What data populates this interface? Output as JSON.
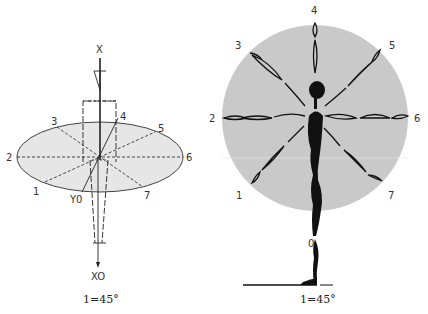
{
  "colors": {
    "background": "#ffffff",
    "ellipse_fill": "#e6e6e6",
    "circle_fill": "#c9c9c9",
    "ink": "#111111",
    "label": "#333333"
  },
  "left_figure": {
    "title": "ellipse projection of direction system",
    "axis_top_label": "X",
    "axis_bottom_label": "XO",
    "origin_label": "Y0",
    "direction_labels": {
      "d1": "1",
      "d2": "2",
      "d3": "3",
      "d4": "4",
      "d5": "5",
      "d6": "6",
      "d7": "7"
    },
    "caption": "1=45°"
  },
  "right_figure": {
    "title": "circle of arm directions around standing figure",
    "direction_labels": {
      "d0": "0",
      "d1": "1",
      "d2": "2",
      "d3": "3",
      "d4": "4",
      "d5": "5",
      "d6": "6",
      "d7": "7"
    },
    "caption": "1=45°"
  }
}
